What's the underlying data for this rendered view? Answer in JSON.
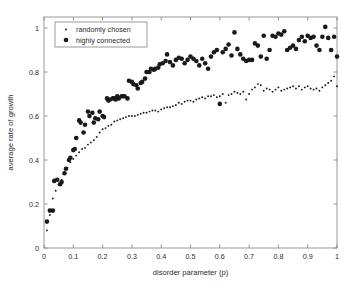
{
  "figure": {
    "background_color": "#ffffff",
    "axes_color": "#808080",
    "marker_color": "#1a1a1a",
    "text_color": "#2b2b2b"
  },
  "legend": {
    "position": "top-left",
    "entries": [
      {
        "label": "randomly chosen",
        "marker": "small-dot",
        "marker_size": 1.1
      },
      {
        "label": "highly connected",
        "marker": "large-dot",
        "marker_size": 2.6
      }
    ]
  },
  "chart_data": {
    "type": "scatter",
    "title": "",
    "xlabel": "disorder parameter (p)",
    "ylabel": "average rate of growth",
    "xlim": [
      0,
      1
    ],
    "ylim": [
      0,
      1.05
    ],
    "xticks": [
      0,
      0.1,
      0.2,
      0.3,
      0.4,
      0.5,
      0.6,
      0.7,
      0.8,
      0.9,
      1
    ],
    "xticklabels": [
      "0",
      "0.1",
      "0.2",
      "0.3",
      "0.4",
      "0.5",
      "0.6",
      "0.7",
      "0.8",
      "0.9",
      "1"
    ],
    "yticks": [
      0,
      0.2,
      0.4,
      0.6,
      0.8,
      1
    ],
    "yticklabels": [
      "0",
      "0.2",
      "0.4",
      "0.6",
      "0.8",
      "1"
    ],
    "grid": false,
    "legend_position": "upper left",
    "series": [
      {
        "name": "randomly chosen",
        "marker": "small-dot",
        "color": "#1a1a1a",
        "x": [
          0.01,
          0.02,
          0.03,
          0.04,
          0.05,
          0.06,
          0.07,
          0.08,
          0.09,
          0.1,
          0.11,
          0.12,
          0.13,
          0.14,
          0.15,
          0.16,
          0.17,
          0.18,
          0.19,
          0.2,
          0.21,
          0.22,
          0.23,
          0.24,
          0.25,
          0.26,
          0.27,
          0.28,
          0.29,
          0.3,
          0.31,
          0.32,
          0.33,
          0.34,
          0.35,
          0.36,
          0.37,
          0.38,
          0.39,
          0.4,
          0.41,
          0.42,
          0.43,
          0.44,
          0.45,
          0.46,
          0.47,
          0.48,
          0.49,
          0.5,
          0.51,
          0.52,
          0.53,
          0.54,
          0.55,
          0.56,
          0.57,
          0.58,
          0.59,
          0.6,
          0.61,
          0.62,
          0.63,
          0.64,
          0.65,
          0.66,
          0.67,
          0.68,
          0.69,
          0.7,
          0.71,
          0.72,
          0.73,
          0.74,
          0.75,
          0.76,
          0.77,
          0.78,
          0.79,
          0.8,
          0.81,
          0.82,
          0.83,
          0.84,
          0.85,
          0.86,
          0.87,
          0.88,
          0.89,
          0.9,
          0.91,
          0.92,
          0.93,
          0.94,
          0.95,
          0.96,
          0.97,
          0.98,
          0.99,
          1.0
        ],
        "y": [
          0.08,
          0.15,
          0.225,
          0.26,
          0.29,
          0.31,
          0.34,
          0.365,
          0.39,
          0.405,
          0.42,
          0.435,
          0.45,
          0.455,
          0.47,
          0.48,
          0.49,
          0.505,
          0.525,
          0.54,
          0.545,
          0.555,
          0.56,
          0.575,
          0.58,
          0.585,
          0.59,
          0.595,
          0.6,
          0.6,
          0.6,
          0.605,
          0.61,
          0.615,
          0.615,
          0.62,
          0.625,
          0.625,
          0.62,
          0.63,
          0.635,
          0.64,
          0.64,
          0.645,
          0.65,
          0.66,
          0.655,
          0.665,
          0.67,
          0.67,
          0.665,
          0.675,
          0.68,
          0.685,
          0.68,
          0.69,
          0.69,
          0.695,
          0.685,
          0.69,
          0.7,
          0.66,
          0.695,
          0.7,
          0.71,
          0.705,
          0.7,
          0.71,
          0.675,
          0.7,
          0.72,
          0.73,
          0.745,
          0.74,
          0.715,
          0.725,
          0.72,
          0.71,
          0.72,
          0.73,
          0.715,
          0.72,
          0.725,
          0.73,
          0.735,
          0.725,
          0.735,
          0.72,
          0.73,
          0.735,
          0.725,
          0.72,
          0.725,
          0.715,
          0.73,
          0.74,
          0.75,
          0.76,
          0.78,
          0.735
        ]
      },
      {
        "name": "highly connected",
        "marker": "large-dot",
        "color": "#1a1a1a",
        "x": [
          0.01,
          0.02,
          0.03,
          0.035,
          0.045,
          0.055,
          0.06,
          0.07,
          0.075,
          0.085,
          0.09,
          0.1,
          0.105,
          0.11,
          0.12,
          0.125,
          0.135,
          0.14,
          0.15,
          0.155,
          0.165,
          0.17,
          0.175,
          0.185,
          0.19,
          0.2,
          0.205,
          0.215,
          0.22,
          0.225,
          0.235,
          0.24,
          0.245,
          0.25,
          0.255,
          0.265,
          0.27,
          0.275,
          0.285,
          0.29,
          0.3,
          0.305,
          0.315,
          0.32,
          0.33,
          0.335,
          0.345,
          0.35,
          0.36,
          0.365,
          0.375,
          0.38,
          0.39,
          0.395,
          0.405,
          0.415,
          0.42,
          0.43,
          0.44,
          0.45,
          0.46,
          0.47,
          0.48,
          0.49,
          0.5,
          0.51,
          0.52,
          0.53,
          0.54,
          0.55,
          0.56,
          0.57,
          0.58,
          0.59,
          0.6,
          0.61,
          0.62,
          0.63,
          0.64,
          0.65,
          0.66,
          0.67,
          0.68,
          0.69,
          0.7,
          0.71,
          0.72,
          0.73,
          0.74,
          0.75,
          0.76,
          0.77,
          0.78,
          0.79,
          0.8,
          0.81,
          0.82,
          0.83,
          0.84,
          0.85,
          0.86,
          0.87,
          0.88,
          0.89,
          0.9,
          0.91,
          0.92,
          0.93,
          0.94,
          0.95,
          0.96,
          0.97,
          0.98,
          0.99,
          1.0
        ],
        "y": [
          0.12,
          0.17,
          0.17,
          0.305,
          0.31,
          0.29,
          0.3,
          0.34,
          0.36,
          0.4,
          0.41,
          0.445,
          0.45,
          0.5,
          0.58,
          0.57,
          0.525,
          0.56,
          0.62,
          0.6,
          0.615,
          0.57,
          0.59,
          0.585,
          0.62,
          0.6,
          0.595,
          0.68,
          0.67,
          0.675,
          0.68,
          0.68,
          0.675,
          0.69,
          0.68,
          0.69,
          0.69,
          0.69,
          0.68,
          0.76,
          0.755,
          0.745,
          0.74,
          0.725,
          0.75,
          0.755,
          0.77,
          0.8,
          0.8,
          0.815,
          0.81,
          0.815,
          0.82,
          0.835,
          0.84,
          0.85,
          0.88,
          0.845,
          0.83,
          0.855,
          0.865,
          0.86,
          0.84,
          0.855,
          0.87,
          0.86,
          0.85,
          0.83,
          0.86,
          0.84,
          0.815,
          0.87,
          0.89,
          0.9,
          0.655,
          0.89,
          0.905,
          0.925,
          0.875,
          0.98,
          0.905,
          0.88,
          0.86,
          0.85,
          0.855,
          0.855,
          0.93,
          0.92,
          0.87,
          0.965,
          0.86,
          0.9,
          0.965,
          0.96,
          0.975,
          0.97,
          0.985,
          0.9,
          0.91,
          0.92,
          0.905,
          0.945,
          0.96,
          0.94,
          0.965,
          0.955,
          0.96,
          0.92,
          0.9,
          0.96,
          1.005,
          0.955,
          0.9,
          0.96,
          0.87
        ]
      }
    ]
  }
}
